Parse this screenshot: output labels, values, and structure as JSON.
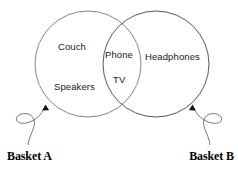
{
  "diagram": {
    "type": "venn",
    "background_color": "#ffffff",
    "stroke_color": "#555555",
    "text_color": "#1a1a1a",
    "label_color": "#000000",
    "sets": [
      {
        "id": "left",
        "name": "Basket A",
        "items": [
          "Couch",
          "Speakers"
        ]
      },
      {
        "id": "right",
        "name": "Basket B",
        "items": [
          "Headphones"
        ]
      }
    ],
    "intersection": {
      "items": [
        "Phone",
        "TV"
      ]
    },
    "callouts": [
      {
        "id": "left-callout",
        "label": "Basket A",
        "points_to": "left"
      },
      {
        "id": "right-callout",
        "label": "Basket B",
        "points_to": "right"
      }
    ],
    "items": {
      "couch": "Couch",
      "speakers": "Speakers",
      "phone": "Phone",
      "tv": "TV",
      "headphones": "Headphones"
    },
    "labels": {
      "basket_a": "Basket A",
      "basket_b": "Basket B"
    }
  }
}
